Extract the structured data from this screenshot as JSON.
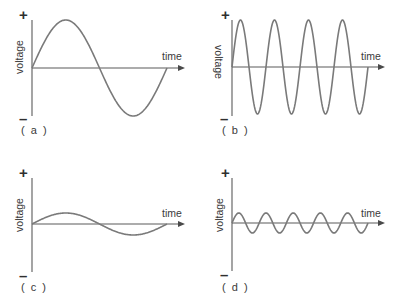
{
  "figure": {
    "panels": [
      {
        "id": "a",
        "caption": "( a )",
        "y_label": "voltage",
        "x_label": "time",
        "plus": "+",
        "minus": "–",
        "origin": [
          32,
          68
        ],
        "axis_top": 20,
        "axis_bottom": 116,
        "x_end": 185,
        "wave_end": 167,
        "amplitude": 48,
        "cycles": 1,
        "y_label_rotation": -90,
        "y_label_pos": [
          20,
          57
        ],
        "plus_pos": [
          24,
          20
        ],
        "minus_pos": [
          24,
          124
        ],
        "caption_pos": [
          21,
          134
        ],
        "x_label_pos": [
          162,
          60
        ]
      },
      {
        "id": "b",
        "caption": "( b )",
        "y_label": "voltage",
        "x_label": "time",
        "plus": "+",
        "minus": "–",
        "origin": [
          232,
          67
        ],
        "axis_top": 20,
        "axis_bottom": 116,
        "x_end": 385,
        "wave_end": 368,
        "amplitude": 47,
        "cycles": 4,
        "y_label_rotation": 90,
        "y_label_pos": [
          218,
          62
        ],
        "plus_pos": [
          226,
          20
        ],
        "minus_pos": [
          225,
          124
        ],
        "caption_pos": [
          222,
          134
        ],
        "x_label_pos": [
          361,
          60
        ]
      },
      {
        "id": "c",
        "caption": "( c )",
        "y_label": "voltage",
        "x_label": "time",
        "plus": "+",
        "minus": "–",
        "origin": [
          32,
          224
        ],
        "axis_top": 178,
        "axis_bottom": 272,
        "x_end": 185,
        "wave_end": 167,
        "amplitude": 11,
        "cycles": 1,
        "y_label_rotation": -90,
        "y_label_pos": [
          20,
          215
        ],
        "plus_pos": [
          24,
          178
        ],
        "minus_pos": [
          24,
          281
        ],
        "caption_pos": [
          21,
          291
        ],
        "x_label_pos": [
          162,
          217
        ]
      },
      {
        "id": "d",
        "caption": "( d )",
        "y_label": "voltage",
        "x_label": "time",
        "plus": "+",
        "minus": "–",
        "origin": [
          232,
          223
        ],
        "axis_top": 178,
        "axis_bottom": 271,
        "x_end": 385,
        "wave_end": 368,
        "amplitude": 10,
        "cycles": 5,
        "y_label_rotation": -90,
        "y_label_pos": [
          220,
          215
        ],
        "plus_pos": [
          226,
          178
        ],
        "minus_pos": [
          225,
          280
        ],
        "caption_pos": [
          222,
          291
        ],
        "x_label_pos": [
          361,
          217
        ]
      }
    ],
    "colors": {
      "wave": "#7a7a7a",
      "axis": "#5a5a5a",
      "text": "#3a3a3a",
      "background": "#ffffff"
    }
  }
}
